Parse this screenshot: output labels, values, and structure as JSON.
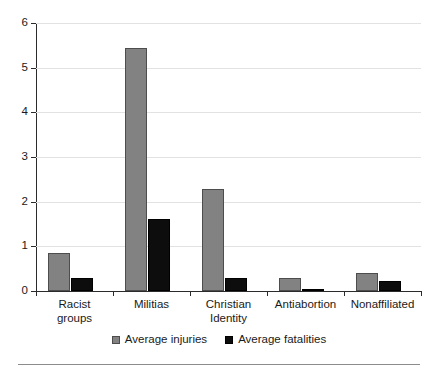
{
  "chart_data": {
    "type": "bar",
    "title": "",
    "subtitle": "",
    "xlabel": "",
    "ylabel": "",
    "ylim": [
      0,
      6
    ],
    "yticks": [
      0,
      1,
      2,
      3,
      4,
      5,
      6
    ],
    "ytick_labels": [
      "0",
      "1",
      "2",
      "3",
      "4",
      "5",
      "6"
    ],
    "grid": true,
    "legend_position": "bottom-center",
    "categories": [
      "Racist groups",
      "Militias",
      "Christian Identity",
      "Antiabortion",
      "Nonaffiliated"
    ],
    "category_lines": [
      [
        "Racist",
        "groups"
      ],
      [
        "Militias",
        ""
      ],
      [
        "Christian",
        "Identity"
      ],
      [
        "Antiabortion",
        ""
      ],
      [
        "Nonaffiliated",
        ""
      ]
    ],
    "series": [
      {
        "name": "Average injuries",
        "color": "#828282",
        "values": [
          0.85,
          5.43,
          2.28,
          0.3,
          0.4
        ]
      },
      {
        "name": "Average fatalities",
        "color": "#0d0d0d",
        "values": [
          0.29,
          1.62,
          0.3,
          0.05,
          0.22
        ]
      }
    ]
  },
  "legend": {
    "items": [
      {
        "label": "Average injuries",
        "swatch": "injuries-swatch"
      },
      {
        "label": "Average fatalities",
        "swatch": "fatalities-swatch"
      }
    ]
  },
  "axis": {
    "y_labels": [
      "0",
      "1",
      "2",
      "3",
      "4",
      "5",
      "6"
    ]
  }
}
